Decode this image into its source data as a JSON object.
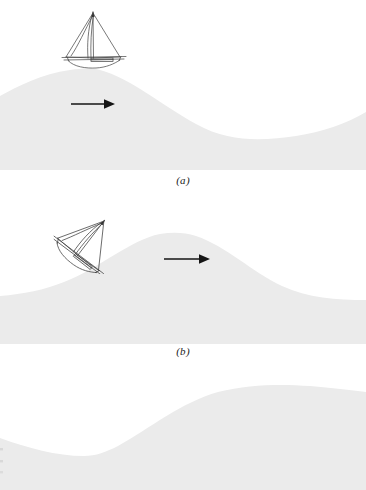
{
  "figure": {
    "name": "sailboat-on-traveling-wave-sequence",
    "background_color": "#ffffff",
    "water_color": "#ebebeb",
    "line_color": "#3a3a3a",
    "arrow_color": "#151515",
    "width": 366,
    "height": 490
  },
  "panels": [
    {
      "id": "a",
      "caption": "(a)",
      "boat": {
        "name": "sailboat",
        "state": "upright at wave crest",
        "rotation_deg": 0
      },
      "arrow": {
        "name": "wave-direction-arrow",
        "direction": "right",
        "meaning": "wave travel direction"
      },
      "wave": {
        "crest_x": 95,
        "crest_y": 72,
        "trough_x": 310,
        "trough_y": 138,
        "baseline_y": 168
      }
    },
    {
      "id": "b",
      "caption": "(b)",
      "boat": {
        "name": "sailboat",
        "state": "heeled on forward slope of wave",
        "rotation_deg": 38
      },
      "arrow": {
        "name": "wave-direction-arrow",
        "direction": "right",
        "meaning": "wave travel direction"
      },
      "wave": {
        "crest_x": 180,
        "crest_y": 235,
        "left_level_y": 296,
        "right_level_y": 300,
        "baseline_y": 340
      }
    },
    {
      "id": "c",
      "caption": "",
      "boat": {
        "name": "sailboat",
        "state": "upright in wave trough",
        "rotation_deg": 0
      },
      "arrow": {
        "name": "wave-direction-arrow",
        "direction": "right",
        "meaning": "wave travel direction"
      },
      "wave": {
        "trough_x": 95,
        "trough_y": 455,
        "crest_x": 330,
        "crest_y": 388,
        "baseline_y": 490
      }
    }
  ]
}
